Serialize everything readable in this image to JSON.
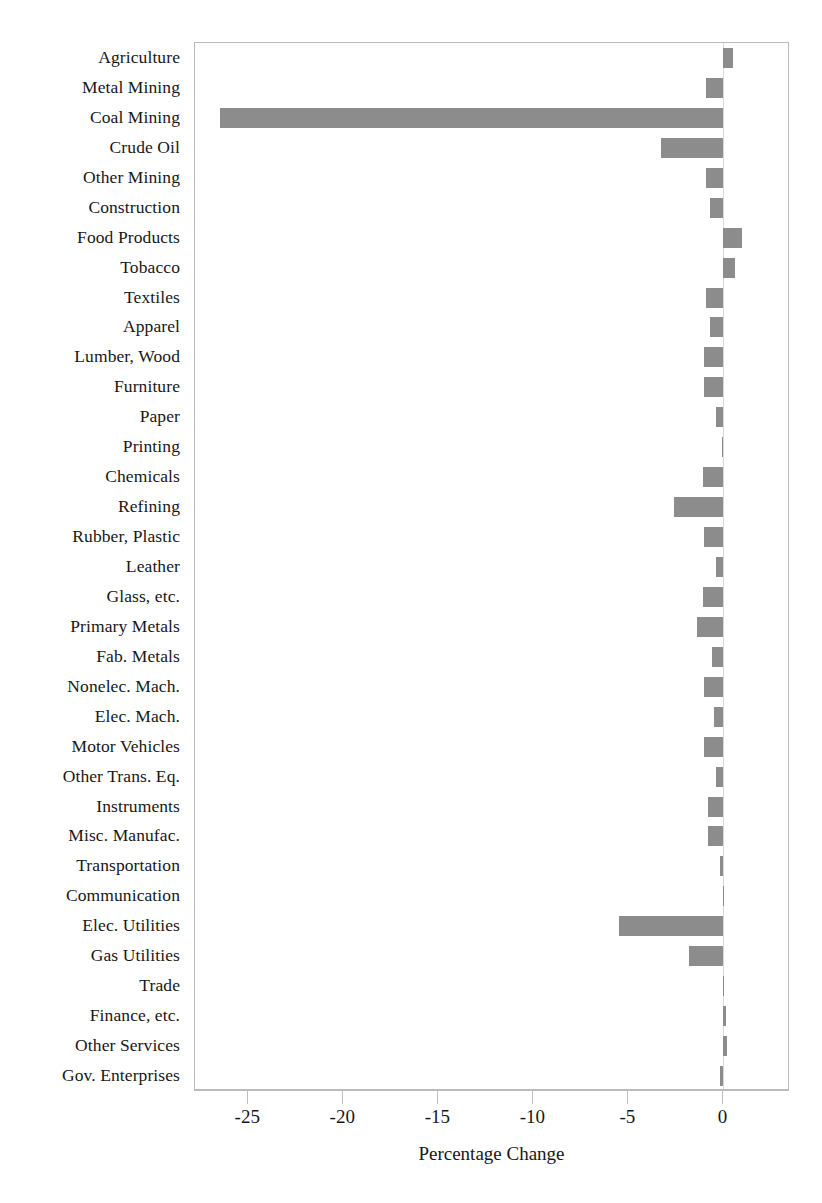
{
  "chart_data": {
    "type": "bar",
    "orientation": "horizontal",
    "title": "",
    "xlabel": "Percentage Change",
    "ylabel": "",
    "xlim": [
      -27.8,
      3.5
    ],
    "xticks": [
      -25,
      -20,
      -15,
      -10,
      -5,
      0
    ],
    "xticklabels": [
      "-25",
      "-20",
      "-15",
      "-10",
      "-5",
      "0"
    ],
    "grid": false,
    "legend": null,
    "bar_color": "#8c8c8c",
    "categories": [
      "Agriculture",
      "Metal Mining",
      "Coal Mining",
      "Crude Oil",
      "Other Mining",
      "Construction",
      "Food Products",
      "Tobacco",
      "Textiles",
      "Apparel",
      "Lumber, Wood",
      "Furniture",
      "Paper",
      "Printing",
      "Chemicals",
      "Refining",
      "Rubber, Plastic",
      "Leather",
      "Glass, etc.",
      "Primary Metals",
      "Fab. Metals",
      "Nonelec. Mach.",
      "Elec. Mach.",
      "Motor Vehicles",
      "Other Trans. Eq.",
      "Instruments",
      "Misc. Manufac.",
      "Transportation",
      "Communication",
      "Elec. Utilities",
      "Gas Utilities",
      "Trade",
      "Finance, etc.",
      "Other Services",
      "Gov. Enterprises"
    ],
    "values": [
      0.5,
      -0.9,
      -26.5,
      -3.3,
      -0.9,
      -0.7,
      1.0,
      0.6,
      -0.9,
      -0.7,
      -1.0,
      -1.0,
      -0.4,
      -0.1,
      -1.1,
      -2.6,
      -1.0,
      -0.4,
      -1.1,
      -1.4,
      -0.6,
      -1.0,
      -0.5,
      -1.0,
      -0.4,
      -0.8,
      -0.8,
      -0.2,
      -0.05,
      -5.5,
      -1.8,
      -0.05,
      0.15,
      0.2,
      -0.2
    ]
  }
}
